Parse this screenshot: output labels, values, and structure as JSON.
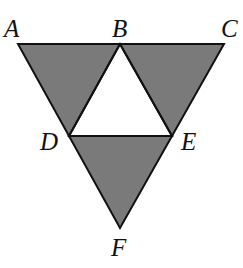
{
  "diagram": {
    "type": "geometry-figure",
    "colors": {
      "shade": "#7a7a7a",
      "stroke": "#111111",
      "background": "#ffffff"
    },
    "points": {
      "A": {
        "label": "A",
        "x": 18,
        "y": 44,
        "label_x": 4,
        "label_y": 37
      },
      "B": {
        "label": "B",
        "x": 120,
        "y": 44,
        "label_x": 112,
        "label_y": 37
      },
      "C": {
        "label": "C",
        "x": 224,
        "y": 44,
        "label_x": 221,
        "label_y": 37
      },
      "D": {
        "label": "D",
        "x": 69,
        "y": 136,
        "label_x": 40,
        "label_y": 150
      },
      "E": {
        "label": "E",
        "x": 172,
        "y": 136,
        "label_x": 181,
        "label_y": 150
      },
      "F": {
        "label": "F",
        "x": 120,
        "y": 228,
        "label_x": 111,
        "label_y": 256
      }
    },
    "shaded_triangles": [
      [
        "A",
        "B",
        "D"
      ],
      [
        "B",
        "C",
        "E"
      ],
      [
        "D",
        "E",
        "F"
      ]
    ],
    "unshaded_triangles": [
      [
        "B",
        "D",
        "E"
      ]
    ]
  }
}
